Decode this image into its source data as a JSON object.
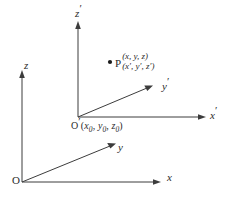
{
  "figure": {
    "background_color": "#ffffff",
    "line_color": "#3c3c3c",
    "text_color": "#2b2b2b"
  },
  "unprimed_frame": {
    "origin_label": "O",
    "axes": [
      {
        "name": "x-axis",
        "label": "x"
      },
      {
        "name": "y-axis",
        "label": "y"
      },
      {
        "name": "z-axis",
        "label": "z"
      }
    ]
  },
  "primed_frame": {
    "origin_letter": "O",
    "origin_prime": "′",
    "origin_coords_open": "(",
    "origin_coords": [
      {
        "symbol": "x",
        "sub": "0"
      },
      {
        "symbol": "y",
        "sub": "0"
      },
      {
        "symbol": "z",
        "sub": "0"
      }
    ],
    "origin_coords_close": ")",
    "origin_label_full": "O′(x₀, y₀, z₀)",
    "axes": [
      {
        "name": "x-prime-axis",
        "label": "x",
        "prime": "′"
      },
      {
        "name": "y-prime-axis",
        "label": "y",
        "prime": "′"
      },
      {
        "name": "z-prime-axis",
        "label": "z",
        "prime": "′"
      }
    ]
  },
  "point": {
    "name": "point-p",
    "letter": "P",
    "coords_unprimed": "(x, y, z)",
    "coords_primed": "(x′, y′, z′)"
  }
}
